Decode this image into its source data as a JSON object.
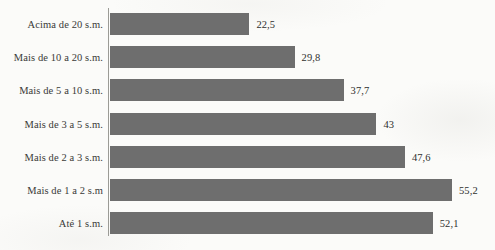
{
  "chart_data": {
    "type": "bar",
    "orientation": "horizontal",
    "title": "",
    "subtitle": "",
    "xlabel": "",
    "ylabel": "",
    "grid": false,
    "legend": false,
    "legend_position": "none",
    "axis": {
      "value_axis_min": 0,
      "value_axis_max": 55.2,
      "category_axis_line_visible": true,
      "value_axis_line_visible": false,
      "tick_labels_visible": false
    },
    "decimal_separator": ",",
    "categories": [
      "Acima de 20 s.m.",
      "Mais de 10 a 20 s.m.",
      "Mais de 5 a 10 s.m.",
      "Mais de 3 a 5 s.m.",
      "Mais de 2 a 3 s.m.",
      "Mais de 1 a 2 s.m",
      "Até 1 s.m."
    ],
    "values": [
      22.5,
      29.8,
      37.7,
      43,
      47.6,
      55.2,
      52.1
    ],
    "value_labels": [
      "22,5",
      "29,8",
      "37,7",
      "43",
      "47,6",
      "55,2",
      "52,1"
    ],
    "colors": {
      "bar_fill": "#6e6e6e",
      "axis_line": "#9b9b96",
      "label_text": "#3a3a38",
      "value_text": "#2f2f2e",
      "background": "#fbfbf9"
    }
  }
}
